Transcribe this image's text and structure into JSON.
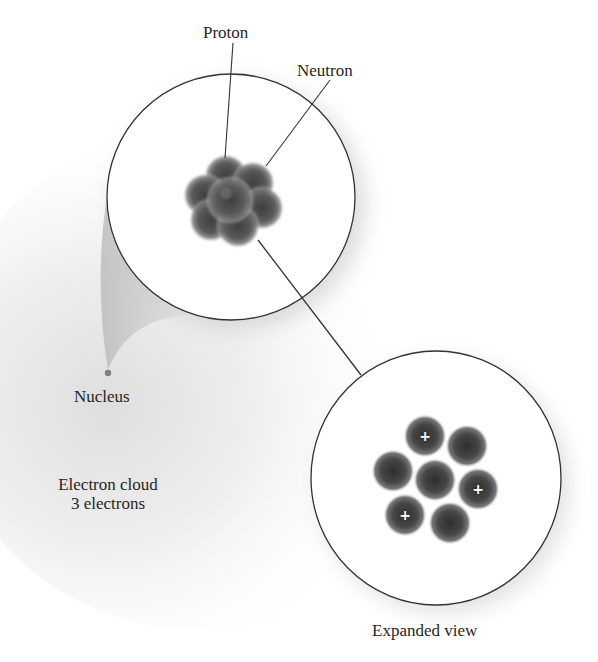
{
  "diagram": {
    "labels": {
      "proton": "Proton",
      "neutron": "Neutron",
      "nucleus": "Nucleus",
      "electron_cloud_line1": "Electron cloud",
      "electron_cloud_line2": "3 electrons",
      "expanded_view": "Expanded view"
    },
    "atom_view": {
      "circle": {
        "cx": 231,
        "cy": 197,
        "rx": 124,
        "ry": 123
      },
      "nucleus_cluster_center": [
        228,
        200
      ]
    },
    "expanded_view": {
      "circle": {
        "cx": 436,
        "cy": 478,
        "rx": 125,
        "ry": 127
      },
      "particles": [
        {
          "type": "proton",
          "cx": 425,
          "cy": 436,
          "symbol": "+"
        },
        {
          "type": "neutron",
          "cx": 467,
          "cy": 446,
          "symbol": ""
        },
        {
          "type": "neutron",
          "cx": 393,
          "cy": 471,
          "symbol": ""
        },
        {
          "type": "neutron",
          "cx": 435,
          "cy": 480,
          "symbol": ""
        },
        {
          "type": "proton",
          "cx": 478,
          "cy": 489,
          "symbol": "+"
        },
        {
          "type": "proton",
          "cx": 405,
          "cy": 515,
          "symbol": "+"
        },
        {
          "type": "neutron",
          "cx": 450,
          "cy": 523,
          "symbol": ""
        }
      ],
      "proton_count": 3,
      "neutron_count": 4
    },
    "electron_count": 3,
    "colors": {
      "outline": "#333333",
      "particle_dark": "#3a3a3a",
      "particle_mid": "#6a6a6a",
      "cloud_shade": "#d9d9d9",
      "nucleus_dot": "#8a7a78"
    }
  }
}
